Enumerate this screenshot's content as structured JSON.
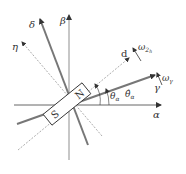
{
  "diagram": {
    "axes": {
      "alpha": "α",
      "beta": "β",
      "gamma": "γ",
      "delta": "δ",
      "d": "d",
      "eta": "η"
    },
    "angles": {
      "theta": "θ",
      "theta_sub": "α",
      "theta_hat": "θ̂",
      "theta_hat_sub": "α"
    },
    "velocities": {
      "omega_2": "ω",
      "omega_2_sub": "2",
      "omega_2_subsub": "h",
      "omega_gamma": "ω",
      "omega_gamma_sub": "γ"
    },
    "magnet": {
      "north": "N",
      "south": "S"
    },
    "colors": {
      "axis": "#999999",
      "dark_axis": "#777777",
      "dashed": "#888888",
      "text": "#333333",
      "magnet_fill": "#ffffff",
      "magnet_stroke": "#333333"
    }
  }
}
